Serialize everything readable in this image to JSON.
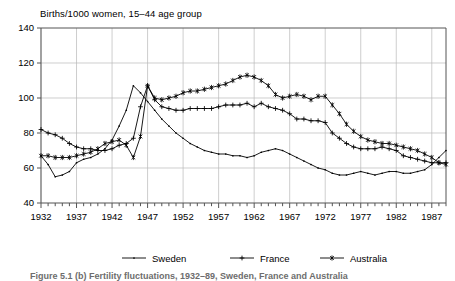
{
  "chart_data": {
    "type": "line",
    "title": "Births/1000 women, 15–44 age group",
    "xlabel": "",
    "ylabel": "",
    "xlim": [
      1932,
      1989
    ],
    "ylim": [
      40,
      140
    ],
    "ytick_step": 20,
    "yticks": [
      40,
      60,
      80,
      100,
      120,
      140
    ],
    "xticks": [
      1932,
      1937,
      1942,
      1947,
      1952,
      1957,
      1962,
      1967,
      1972,
      1977,
      1982,
      1987
    ],
    "xtick_labels": [
      "1932",
      "1937",
      "1942",
      "1947",
      "1952",
      "1957",
      "1962",
      "1967",
      "1972",
      "1977",
      "1982",
      "1987"
    ],
    "minor_xtick_interval": 1,
    "grid": true,
    "grid_axis": "both",
    "legend_position": "bottom",
    "x": [
      1932,
      1933,
      1934,
      1935,
      1936,
      1937,
      1938,
      1939,
      1940,
      1941,
      1942,
      1943,
      1944,
      1945,
      1946,
      1947,
      1948,
      1949,
      1950,
      1951,
      1952,
      1953,
      1954,
      1955,
      1956,
      1957,
      1958,
      1959,
      1960,
      1961,
      1962,
      1963,
      1964,
      1965,
      1966,
      1967,
      1968,
      1969,
      1970,
      1971,
      1972,
      1973,
      1974,
      1975,
      1976,
      1977,
      1978,
      1979,
      1980,
      1981,
      1982,
      1983,
      1984,
      1985,
      1986,
      1987,
      1988,
      1989
    ],
    "series": [
      {
        "name": "Sweden",
        "marker": "dot",
        "values": [
          67,
          62,
          55,
          56,
          58,
          63,
          65,
          66,
          68,
          71,
          76,
          84,
          93,
          107,
          103,
          98,
          93,
          88,
          84,
          80,
          77,
          74,
          72,
          70,
          69,
          68,
          68,
          67,
          67,
          66,
          67,
          69,
          70,
          71,
          70,
          68,
          66,
          64,
          62,
          60,
          59,
          57,
          56,
          56,
          57,
          58,
          57,
          56,
          57,
          58,
          58,
          57,
          57,
          58,
          59,
          62,
          66,
          70
        ]
      },
      {
        "name": "France",
        "marker": "plus",
        "values": [
          82,
          80,
          79,
          77,
          74,
          72,
          71,
          71,
          70,
          70,
          71,
          73,
          74,
          77,
          95,
          107,
          99,
          95,
          94,
          93,
          93,
          94,
          94,
          94,
          94,
          95,
          96,
          96,
          96,
          97,
          95,
          97,
          95,
          94,
          93,
          91,
          88,
          88,
          87,
          87,
          86,
          80,
          77,
          74,
          72,
          71,
          71,
          71,
          72,
          71,
          70,
          67,
          66,
          65,
          64,
          63,
          63,
          63
        ]
      },
      {
        "name": "Australia",
        "marker": "asterisk",
        "values": [
          67,
          67,
          66,
          66,
          66,
          67,
          68,
          69,
          71,
          74,
          75,
          76,
          73,
          66,
          78,
          107,
          100,
          99,
          100,
          101,
          103,
          104,
          104,
          105,
          106,
          107,
          108,
          110,
          112,
          113,
          112,
          110,
          107,
          102,
          100,
          101,
          102,
          101,
          99,
          101,
          101,
          96,
          91,
          85,
          81,
          78,
          76,
          75,
          74,
          74,
          73,
          72,
          71,
          70,
          68,
          66,
          63,
          62
        ]
      }
    ]
  },
  "legend": {
    "items": [
      {
        "label": "Sweden",
        "marker": "dot"
      },
      {
        "label": "France",
        "marker": "plus"
      },
      {
        "label": "Australia",
        "marker": "asterisk"
      }
    ]
  },
  "caption": {
    "text": "Figure 5.1 (b) Fertility fluctuations, 1932–89, Sweden, France and Australia"
  }
}
